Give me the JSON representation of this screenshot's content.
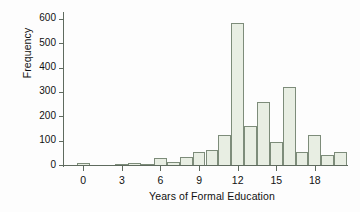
{
  "chart_data": {
    "type": "bar",
    "title": "",
    "xlabel": "Years of Formal Education",
    "ylabel": "Frequency",
    "xlim": [
      -1.5,
      20.5
    ],
    "ylim": [
      0,
      620
    ],
    "grid": false,
    "legend": "none",
    "bin_width": 1,
    "xticks": [
      0,
      3,
      6,
      9,
      12,
      15,
      18
    ],
    "yticks": [
      0,
      100,
      200,
      300,
      400,
      500,
      600
    ],
    "categories": [
      0,
      1,
      2,
      3,
      4,
      5,
      6,
      7,
      8,
      9,
      10,
      11,
      12,
      13,
      14,
      15,
      16,
      17,
      18,
      19,
      20
    ],
    "values": [
      8,
      0,
      0,
      4,
      9,
      3,
      29,
      14,
      32,
      53,
      61,
      122,
      585,
      159,
      257,
      96,
      322,
      53,
      125,
      41,
      53
    ],
    "bar_fill": "#e8eee3",
    "bar_stroke": "#7d8c7a",
    "axis_color": "#5f6b5f"
  },
  "axes": {
    "y_tick_labels": [
      "0",
      "100",
      "200",
      "300",
      "400",
      "500",
      "600"
    ],
    "x_tick_labels": [
      "0",
      "3",
      "6",
      "9",
      "12",
      "15",
      "18"
    ],
    "y_axis_title": "Frequency",
    "x_axis_title": "Years of Formal Education"
  }
}
